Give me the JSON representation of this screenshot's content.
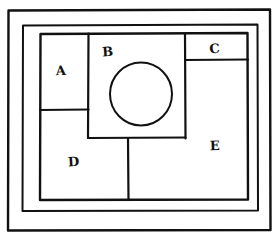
{
  "diagram": {
    "style": {
      "background_color": "#ffffff",
      "stroke_color": "#111111",
      "label_color": "#111111"
    },
    "borders": [
      {
        "name": "outer-border",
        "x": 7,
        "y": 9,
        "width": 264,
        "height": 222,
        "stroke_width": 2.4
      },
      {
        "name": "middle-border",
        "x": 22,
        "y": 24,
        "width": 236,
        "height": 187,
        "stroke_width": 2.0
      }
    ],
    "content_rect": {
      "name": "content-rect",
      "x": 40,
      "y": 33,
      "width": 208,
      "height": 167,
      "stroke_width": 2.4
    },
    "regions": [
      {
        "id": "A",
        "label": "A",
        "x": 40,
        "y": 33,
        "width": 48,
        "height": 77,
        "label_x": 61,
        "label_y": 75
      },
      {
        "id": "B",
        "label": "B",
        "x": 88,
        "y": 33,
        "width": 97,
        "height": 105,
        "label_x": 108,
        "label_y": 56
      },
      {
        "id": "C",
        "label": "C",
        "x": 185,
        "y": 33,
        "width": 63,
        "height": 27,
        "label_x": 215,
        "label_y": 53
      },
      {
        "id": "D",
        "label": "D",
        "x": 40,
        "y": 110,
        "width": 88,
        "height": 90,
        "label_x": 74,
        "label_y": 166
      },
      {
        "id": "E",
        "label": "E",
        "x": 185,
        "y": 60,
        "width": 63,
        "height": 140,
        "label_x": 215,
        "label_y": 150
      }
    ],
    "circle": {
      "name": "center-circle",
      "cx": 141,
      "cy": 94,
      "rx": 31,
      "ry": 31,
      "stroke_width": 2.0
    },
    "dividers": [
      {
        "name": "divider-a-d",
        "orientation": "horizontal",
        "x1": 40,
        "y1": 110,
        "x2": 88,
        "y2": 110
      },
      {
        "name": "divider-a-b",
        "orientation": "vertical",
        "x1": 88,
        "y1": 33,
        "x2": 88,
        "y2": 138
      },
      {
        "name": "divider-b-ce",
        "orientation": "vertical",
        "x1": 185,
        "y1": 33,
        "x2": 185,
        "y2": 138
      },
      {
        "name": "divider-c-e",
        "orientation": "horizontal",
        "x1": 185,
        "y1": 60,
        "x2": 248,
        "y2": 60
      },
      {
        "name": "divider-b-bottom",
        "orientation": "horizontal",
        "x1": 88,
        "y1": 138,
        "x2": 185,
        "y2": 138
      },
      {
        "name": "divider-d-lower",
        "orientation": "vertical",
        "x1": 128,
        "y1": 138,
        "x2": 128,
        "y2": 200
      }
    ]
  }
}
